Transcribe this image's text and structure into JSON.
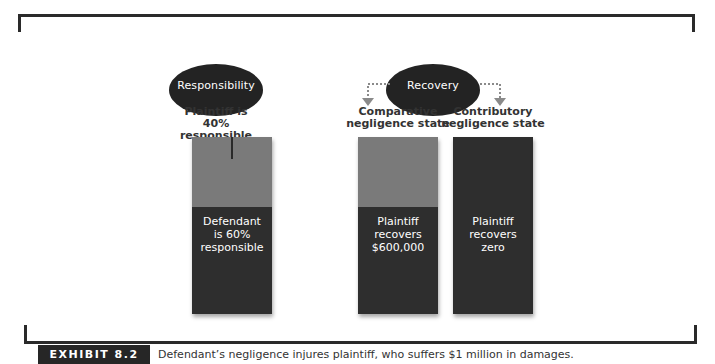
{
  "diagram": {
    "responsibility": {
      "title": "Responsibility",
      "plaintiff_label_line1": "Plaintiff is",
      "plaintiff_label_line2": "40% responsible",
      "bar": {
        "top_share_pct": 40,
        "bottom_line1": "Defendant",
        "bottom_line2": "is 60%",
        "bottom_line3": "responsible"
      }
    },
    "recovery": {
      "title": "Recovery",
      "comparative": {
        "label_line1": "Comparative",
        "label_line2": "negligence state",
        "bar": {
          "text_line1": "Plaintiff",
          "text_line2": "recovers",
          "text_line3": "$600,000"
        }
      },
      "contributory": {
        "label_line1": "Contributory",
        "label_line2": "negligence state",
        "bar": {
          "text_line1": "Plaintiff",
          "text_line2": "recovers",
          "text_line3": "zero"
        }
      }
    },
    "colors": {
      "dark": "#2e2e2e",
      "light_gray": "#7a7a7a",
      "arrow_gray": "#8a8a8a"
    }
  },
  "caption": {
    "badge": "EXHIBIT 8.2",
    "text": "Defendant’s negligence injures plaintiff, who suffers $1 million in damages."
  }
}
